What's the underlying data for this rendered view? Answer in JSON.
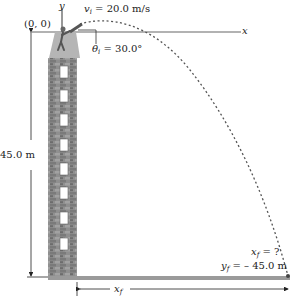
{
  "diagram": {
    "type": "projectile-motion",
    "origin_label": "(0, 0)",
    "axis_y_label": "y",
    "axis_x_label": "x",
    "initial_velocity": {
      "symbol": "v",
      "subscript": "i",
      "value": "= 20.0 m/s"
    },
    "launch_angle": {
      "symbol": "θ",
      "subscript": "i",
      "value": "= 30.0°"
    },
    "height_label": "45.0 m",
    "final_x": {
      "symbol": "x",
      "subscript": "f",
      "value": "= ?"
    },
    "final_y": {
      "symbol": "y",
      "subscript": "f",
      "value": "= – 45.0 m"
    },
    "range_label": {
      "symbol": "x",
      "subscript": "f"
    },
    "colors": {
      "building": "#8e8e8e",
      "building_dark": "#6f6f6f",
      "ground": "#9a9a9a",
      "trajectory": "#555555",
      "window": "#ffffff"
    },
    "building_window_count": 8
  }
}
